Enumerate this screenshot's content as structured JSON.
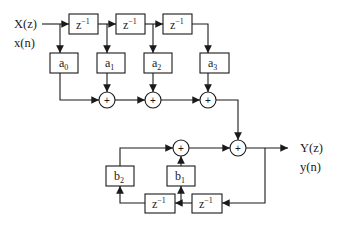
{
  "input": {
    "label_z": "X(z)",
    "label_n": "x(n)"
  },
  "output": {
    "label_z": "Y(z)",
    "label_n": "y(n)"
  },
  "delay": {
    "base": "z",
    "exp": "−1"
  },
  "adder_symbol": "+",
  "feedforward": [
    {
      "base": "a",
      "sub": "0"
    },
    {
      "base": "a",
      "sub": "1"
    },
    {
      "base": "a",
      "sub": "2"
    },
    {
      "base": "a",
      "sub": "3"
    }
  ],
  "feedback": [
    {
      "base": "b",
      "sub": "1"
    },
    {
      "base": "b",
      "sub": "2"
    }
  ]
}
